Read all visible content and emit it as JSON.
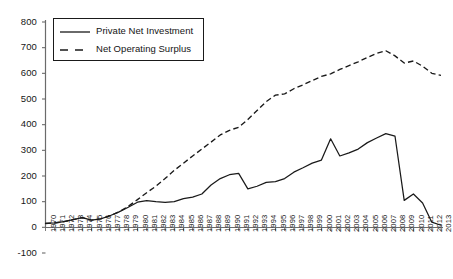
{
  "chart_data": {
    "type": "line",
    "title": "",
    "subtitle": "",
    "xlabel": "",
    "ylabel": "",
    "grid": false,
    "legend_position": "upper-left",
    "ylim": [
      -100,
      800
    ],
    "yticks": [
      -100,
      0,
      100,
      200,
      300,
      400,
      500,
      600,
      700,
      800
    ],
    "ytick_labels": [
      "-100",
      "0",
      "100",
      "200",
      "300",
      "400",
      "500",
      "600",
      "700",
      "800"
    ],
    "x": [
      1970,
      1971,
      1972,
      1973,
      1974,
      1975,
      1976,
      1977,
      1978,
      1979,
      1980,
      1981,
      1982,
      1983,
      1984,
      1985,
      1986,
      1987,
      1988,
      1989,
      1990,
      1991,
      1992,
      1993,
      1994,
      1995,
      1996,
      1997,
      1998,
      1999,
      2000,
      2001,
      2002,
      2003,
      2004,
      2005,
      2006,
      2007,
      2008,
      2009,
      2010,
      2011,
      2012,
      2013
    ],
    "categories": [
      "1970",
      "1971",
      "1972",
      "1973",
      "1974",
      "1975",
      "1976",
      "1977",
      "1978",
      "1979",
      "1980",
      "1981",
      "1982",
      "1983",
      "1984",
      "1985",
      "1986",
      "1987",
      "1988",
      "1989",
      "1990",
      "1991",
      "1992",
      "1993",
      "1994",
      "1995",
      "1996",
      "1997",
      "1998",
      "1999",
      "2000",
      "2001",
      "2002",
      "2003",
      "2004",
      "2005",
      "2006",
      "2007",
      "2008",
      "2009",
      "2010",
      "2011",
      "2012",
      "2013"
    ],
    "series": [
      {
        "name": "Private Net Investment",
        "style": "solid",
        "color": "#1a1a1a",
        "values": [
          15,
          17,
          22,
          30,
          38,
          28,
          33,
          45,
          60,
          78,
          98,
          104,
          100,
          97,
          100,
          112,
          118,
          130,
          165,
          190,
          205,
          210,
          150,
          160,
          175,
          178,
          190,
          215,
          232,
          250,
          262,
          345,
          278,
          290,
          305,
          330,
          348,
          365,
          355,
          105,
          130,
          95,
          20,
          8
        ]
      },
      {
        "name": "Net Operating Surplus",
        "style": "dashed",
        "color": "#1a1a1a",
        "values": [
          15,
          17,
          22,
          30,
          38,
          28,
          33,
          45,
          60,
          82,
          108,
          135,
          160,
          190,
          222,
          250,
          278,
          305,
          332,
          360,
          378,
          390,
          420,
          455,
          490,
          515,
          520,
          540,
          555,
          572,
          588,
          598,
          615,
          630,
          645,
          662,
          678,
          688,
          668,
          640,
          648,
          628,
          600,
          592
        ]
      }
    ]
  },
  "legend": {
    "entries": [
      {
        "label": "Private Net Investment",
        "style": "solid"
      },
      {
        "label": "Net Operating Surplus",
        "style": "dashed"
      }
    ]
  },
  "axes": {
    "y_axis_name": "value-axis",
    "x_axis_name": "year-axis"
  },
  "colors": {
    "line": "#1a1a1a",
    "axis": "#555555",
    "background": "#ffffff"
  }
}
